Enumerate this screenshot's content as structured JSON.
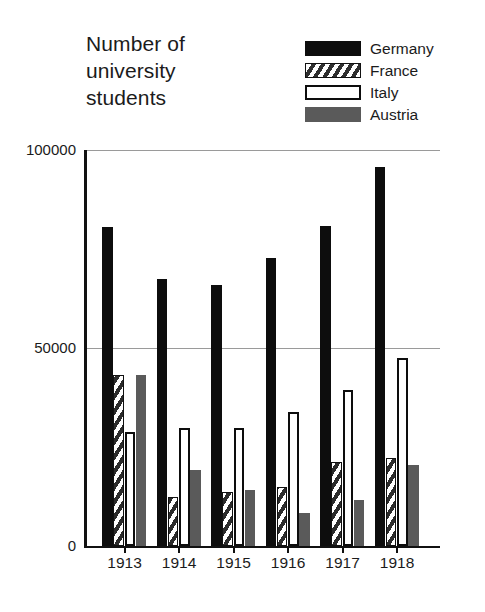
{
  "chart_data": {
    "type": "bar",
    "title": "Number of university students",
    "xlabel": "",
    "ylabel": "",
    "categories": [
      "1913",
      "1914",
      "1915",
      "1916",
      "1917",
      "1918"
    ],
    "ylim": [
      0,
      100000
    ],
    "yticks": [
      0,
      50000,
      100000
    ],
    "ytick_labels": [
      "0",
      "50000",
      "100000"
    ],
    "grid": true,
    "legend_position": "top-right",
    "series": [
      {
        "name": "Germany",
        "color": "#0d0d0d",
        "pattern": "solid-black",
        "values": [
          80600,
          67500,
          65900,
          72700,
          80800,
          95700
        ]
      },
      {
        "name": "France",
        "color": "#2e2e2e",
        "pattern": "diagonal-hatch",
        "values": [
          43200,
          12400,
          13600,
          14900,
          21200,
          22200
        ]
      },
      {
        "name": "Italy",
        "color": "#ffffff",
        "pattern": "white-outline",
        "values": [
          28800,
          29800,
          29800,
          33800,
          39400,
          47500
        ]
      },
      {
        "name": "Austria",
        "color": "#5a5a5a",
        "pattern": "solid-gray",
        "values": [
          43200,
          19200,
          14100,
          8300,
          11600,
          20500
        ]
      }
    ]
  },
  "title": {
    "line1": "Number of",
    "line2": "university",
    "line3": "students"
  },
  "legend": {
    "items": [
      {
        "label": "Germany",
        "swatch": "solid-black-swatch"
      },
      {
        "label": "France",
        "swatch": "hatched-swatch"
      },
      {
        "label": "Italy",
        "swatch": "white-outline-swatch"
      },
      {
        "label": "Austria",
        "swatch": "solid-gray-swatch"
      }
    ]
  },
  "axis": {
    "y_labels": [
      "100000",
      "50000",
      "0"
    ],
    "x_labels": [
      "1913",
      "1914",
      "1915",
      "1916",
      "1917",
      "1918"
    ]
  }
}
